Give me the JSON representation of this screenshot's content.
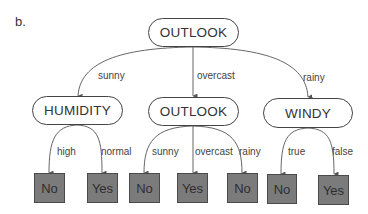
{
  "panel_label": "b.",
  "tree": {
    "root": {
      "label": "OUTLOOK",
      "edges": [
        "sunny",
        "overcast",
        "rainy"
      ]
    },
    "level1": [
      {
        "label": "HUMIDITY",
        "edge_from_root": "sunny",
        "edges": [
          "high",
          "normal"
        ],
        "leaves": [
          "No",
          "Yes"
        ]
      },
      {
        "label": "OUTLOOK",
        "edge_from_root": "overcast",
        "edges": [
          "sunny",
          "overcast",
          "rainy"
        ],
        "leaves": [
          "No",
          "Yes",
          "No"
        ]
      },
      {
        "label": "WINDY",
        "edge_from_root": "rainy",
        "edges": [
          "true",
          "false"
        ],
        "leaves": [
          "No",
          "Yes"
        ]
      }
    ]
  },
  "colors": {
    "leaf_fill": "#7b7b7b",
    "leaf_border": "#4a4a4a",
    "node_border": "#444444",
    "edge_stroke": "#555555"
  }
}
